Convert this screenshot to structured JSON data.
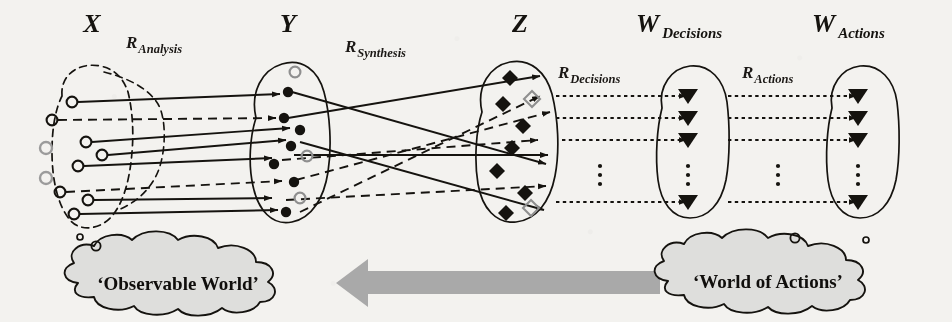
{
  "diagram": {
    "title_note": "Three-level mapping diagram: Observable World to World of Actions",
    "background_color": "#f3f2ef",
    "ink_color": "#15130f",
    "gray_arrow_color": "#a9a9a9",
    "cloud_fill": "#dededc"
  },
  "sets": [
    {
      "id": "X",
      "label_main": "X",
      "label_sub": "",
      "label_x": 92,
      "label_y": 32,
      "boundary": "dashed-ellipse",
      "node_shape": "circle-open",
      "node_count": 8,
      "extra_gray_nodes": 2
    },
    {
      "id": "Y",
      "label_main": "Y",
      "label_sub": "",
      "label_x": 290,
      "label_y": 32,
      "boundary": "solid-ellipse",
      "node_shape": "circle-filled",
      "node_count": 7,
      "extra_gray_nodes": 3
    },
    {
      "id": "Z",
      "label_main": "Z",
      "label_sub": "",
      "label_x": 520,
      "label_y": 32,
      "boundary": "solid-ellipse",
      "node_shape": "diamond-filled",
      "node_count": 7,
      "extra_gray_nodes": 2
    },
    {
      "id": "WDecisions",
      "label_main": "W",
      "label_sub": "Decisions",
      "label_x": 668,
      "label_y": 32,
      "boundary": "solid-ellipse",
      "node_shape": "triangle-down",
      "node_count": 4,
      "extra_gray_nodes": 0
    },
    {
      "id": "WActions",
      "label_main": "W",
      "label_sub": "Actions",
      "label_x": 838,
      "label_y": 32,
      "boundary": "solid-ellipse",
      "node_shape": "triangle-down",
      "node_count": 4,
      "extra_gray_nodes": 0
    }
  ],
  "relations": [
    {
      "id": "RAnalysis",
      "label_main": "R",
      "label_sub": "Analysis",
      "label_x": 140,
      "label_y": 48,
      "edge_style": "solid-and-dashed"
    },
    {
      "id": "RSynthesis",
      "label_main": "R",
      "label_sub": "Synthesis",
      "label_x": 350,
      "label_y": 52,
      "edge_style": "solid-and-dashed-crossing"
    },
    {
      "id": "RDecisions",
      "label_main": "R",
      "label_sub": "Decisions",
      "label_x": 558,
      "label_y": 72,
      "edge_style": "dotted"
    },
    {
      "id": "RActions",
      "label_main": "R",
      "label_sub": "Actions",
      "label_x": 740,
      "label_y": 72,
      "edge_style": "dotted"
    }
  ],
  "clouds": [
    {
      "id": "observable-world",
      "text": "‘Observable World’",
      "cx": 182,
      "cy": 285
    },
    {
      "id": "world-of-actions",
      "text": "‘World of Actions’",
      "cx": 768,
      "cy": 283
    }
  ],
  "flow_arrow": {
    "id": "feedback-arrow",
    "direction": "left",
    "x_start": 660,
    "x_end": 336,
    "y": 282,
    "color": "#a9a9a9"
  },
  "ellipsis": {
    "glyph": "⋮",
    "positions": [
      {
        "set": "WDecisions",
        "x": 688,
        "y": 178
      },
      {
        "set": "WActions",
        "x": 858,
        "y": 178
      },
      {
        "set": "RDecisions",
        "x": 600,
        "y": 178
      },
      {
        "set": "RActions",
        "x": 778,
        "y": 178
      }
    ]
  }
}
